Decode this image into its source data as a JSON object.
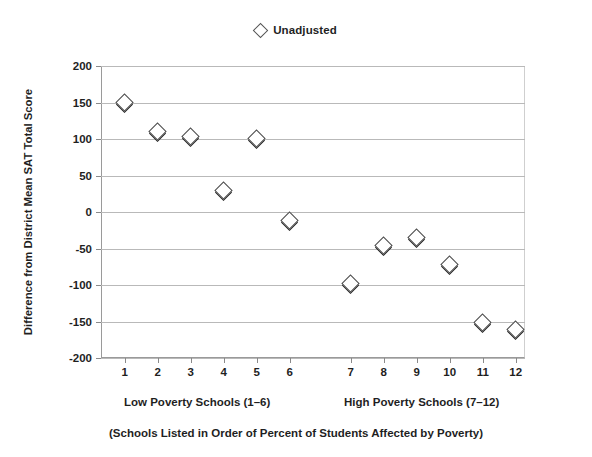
{
  "legend": {
    "marker_icon": "diamond-marker-icon",
    "label": "Unadjusted"
  },
  "axes": {
    "y_title": "Difference from District Mean SAT Total Score",
    "y_ticks": [
      "200",
      "150",
      "100",
      "50",
      "0",
      "-50",
      "-100",
      "-150",
      "-200"
    ],
    "x_ticks": [
      "1",
      "2",
      "3",
      "4",
      "5",
      "6",
      "7",
      "8",
      "9",
      "10",
      "11",
      "12"
    ]
  },
  "captions": {
    "low_poverty": "Low Poverty Schools (1–6)",
    "high_poverty": "High Poverty Schools (7–12)",
    "footer": "(Schools Listed in Order of Percent of Students Affected by Poverty)"
  },
  "colors": {
    "marker_fill": "#ffffff",
    "marker_stroke": "#4a4a4a",
    "marker_shadow": "#1a1a1a",
    "gridline": "#b9b9b9",
    "axis": "#9a9a9a",
    "text": "#1f1f1f"
  },
  "chart_data": {
    "type": "scatter",
    "title": "",
    "xlabel": "(Schools Listed in Order of Percent of Students Affected by Poverty)",
    "ylabel": "Difference from District Mean SAT Total Score",
    "categories": [
      "1",
      "2",
      "3",
      "4",
      "5",
      "6",
      "7",
      "8",
      "9",
      "10",
      "11",
      "12"
    ],
    "series": [
      {
        "name": "Unadjusted",
        "marker": "diamond",
        "values": [
          150,
          110,
          103,
          29,
          101,
          -12,
          -98,
          -46,
          -35,
          -72,
          -152,
          -161
        ]
      }
    ],
    "ylim": [
      -200,
      200
    ],
    "yticks": [
      200,
      150,
      100,
      50,
      0,
      -50,
      -100,
      -150,
      -200
    ],
    "grid": true,
    "legend_position": "top-center",
    "annotations": [
      "Low Poverty Schools (1–6)",
      "High Poverty Schools (7–12)"
    ]
  }
}
